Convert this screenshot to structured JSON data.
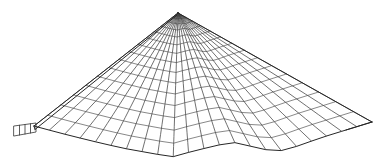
{
  "figure": {
    "background_color": "#ffffff",
    "line_color": "#404040",
    "outline_color": "#262626",
    "ring_color": "#555555",
    "canvas": {
      "width": 385,
      "height": 167
    }
  },
  "chart_data": {
    "type": "line",
    "subtitle": "",
    "xlabel": "",
    "ylabel": "",
    "grid": true,
    "legend": null,
    "xlim": [
      0,
      385
    ],
    "ylim": [
      0,
      167
    ],
    "apex": {
      "x": 178,
      "y": 13
    },
    "left_tip": {
      "x": 34,
      "y": 126
    },
    "right_tip": {
      "x": 372,
      "y": 122
    },
    "radial_line_count": 23,
    "ring_count": 16,
    "cap_stripe_count": 4,
    "cap_region": {
      "x": 14,
      "y": 123,
      "width": 22,
      "height": 13
    },
    "bottom_boundary_points": [
      {
        "x": 34,
        "y": 126
      },
      {
        "x": 60,
        "y": 133
      },
      {
        "x": 92,
        "y": 141
      },
      {
        "x": 122,
        "y": 148
      },
      {
        "x": 150,
        "y": 153
      },
      {
        "x": 172,
        "y": 157
      },
      {
        "x": 190,
        "y": 152
      },
      {
        "x": 210,
        "y": 147
      },
      {
        "x": 232,
        "y": 142
      },
      {
        "x": 254,
        "y": 147
      },
      {
        "x": 276,
        "y": 152
      },
      {
        "x": 298,
        "y": 146
      },
      {
        "x": 320,
        "y": 138
      },
      {
        "x": 346,
        "y": 130
      },
      {
        "x": 372,
        "y": 122
      }
    ],
    "series": [
      {
        "name": "radial-generatrix-lines",
        "description": "Straight lines running from the cone apex outward to the scalloped base boundary",
        "values": [
          23
        ]
      },
      {
        "name": "concentric-ring-lines",
        "description": "Curved rings at increasing radius from the apex, more densely spaced near the apex",
        "values": [
          16
        ]
      },
      {
        "name": "silhouette-outline",
        "description": "Left and right straight silhouette edges from apex to the left and right base tips",
        "values": [
          2
        ]
      }
    ]
  }
}
